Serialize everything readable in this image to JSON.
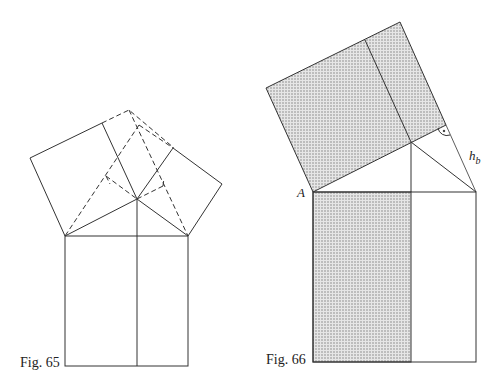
{
  "figures": [
    {
      "caption": "Fig. 65",
      "description": "Pythagorean dissection: squares on legs of right triangle with dashed construction lines, and square on hypotenuse divided by altitude"
    },
    {
      "caption": "Fig. 66",
      "description": "Shaded square on leg equals shaded rectangle on hypotenuse (Euclid's proof)",
      "labels": {
        "vertex_a": "A",
        "height": "h",
        "height_sub": "b"
      },
      "shade_color": "#c8c8c8"
    }
  ]
}
